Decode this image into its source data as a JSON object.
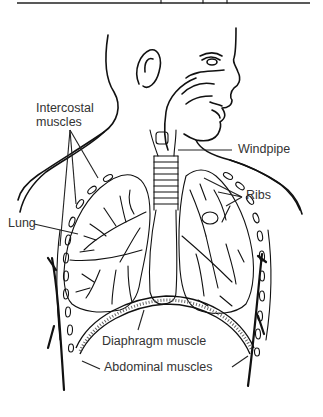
{
  "figure": {
    "line_color": "#111111",
    "label_color": "#333333",
    "background": "#ffffff"
  },
  "labels": {
    "intercostal_line1": "Intercostal",
    "intercostal_line2": "muscles",
    "windpipe": "Windpipe",
    "ribs": "Ribs",
    "lung": "Lung",
    "diaphragm": "Diaphragm muscle",
    "abdominal": "Abdominal muscles"
  }
}
